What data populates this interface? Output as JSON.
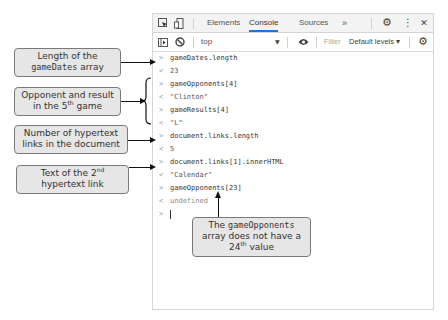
{
  "devtools": {
    "tabs": [
      {
        "label": "Elements",
        "active": false
      },
      {
        "label": "Console",
        "active": true
      },
      {
        "label": "Sources",
        "active": false
      }
    ],
    "more_tabs_glyph": "»",
    "settings_glyph": "⚙",
    "menu_glyph": "⋮",
    "close_glyph": "✕",
    "toolbar": {
      "context": "top",
      "context_arrow": "▼",
      "filter_placeholder": "Filter",
      "levels": "Default levels ▾",
      "settings_glyph": "⚙"
    }
  },
  "console": {
    "lines": [
      {
        "type": "input",
        "prompt": ">",
        "text": "gameDates.length"
      },
      {
        "type": "result",
        "prompt": "<",
        "text": "23"
      },
      {
        "type": "input",
        "prompt": ">",
        "text": "gameOpponents[4]"
      },
      {
        "type": "result",
        "prompt": "<",
        "text": "\"Clinton\""
      },
      {
        "type": "input",
        "prompt": ">",
        "text": "gameResults[4]"
      },
      {
        "type": "result",
        "prompt": "<",
        "text": "\"L\""
      },
      {
        "type": "input",
        "prompt": ">",
        "text": "document.links.length"
      },
      {
        "type": "result",
        "prompt": "<",
        "text": "5"
      },
      {
        "type": "input",
        "prompt": ">",
        "text": "document.links[1].innerHTML"
      },
      {
        "type": "result",
        "prompt": "<",
        "text": "\"Calendar\""
      },
      {
        "type": "input",
        "prompt": ">",
        "text": "gameOpponents[23]"
      },
      {
        "type": "result",
        "prompt": "<",
        "text": "undefined"
      },
      {
        "type": "prompt",
        "prompt": ">",
        "text": ""
      }
    ]
  },
  "callouts": {
    "length": {
      "line1": "Length of the",
      "mono": "gameDates",
      "line2_suffix": " array"
    },
    "opponent": {
      "line1": "Opponent and result",
      "line2_prefix": "in the 5",
      "sup": "th",
      "line2_suffix": " game"
    },
    "links": {
      "line1": "Number of hypertext",
      "line2": "links in the document"
    },
    "text": {
      "line1_prefix": "Text of the 2",
      "sup": "nd",
      "line2": "hypertext link"
    },
    "undefined": {
      "line1_prefix": "The ",
      "mono": "gameOpponents",
      "line2": "array does not have a",
      "line3_prefix": "24",
      "sup": "th",
      "line3_suffix": " value"
    }
  }
}
